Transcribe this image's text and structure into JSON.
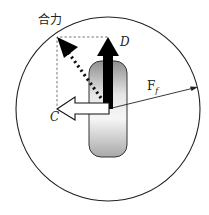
{
  "diagram": {
    "labels": {
      "resultant": "合力",
      "d_force": "D",
      "c_force": "C",
      "friction_main": "F",
      "friction_sub": "f"
    },
    "colors": {
      "circle": "#222222",
      "tire_light": "#f4f4f4",
      "tire_dark": "#9a9a9a",
      "arrow_d": "#000000",
      "arrow_c_fill": "#ffffff",
      "dashed": "#555555",
      "dotted": "#111111"
    }
  }
}
